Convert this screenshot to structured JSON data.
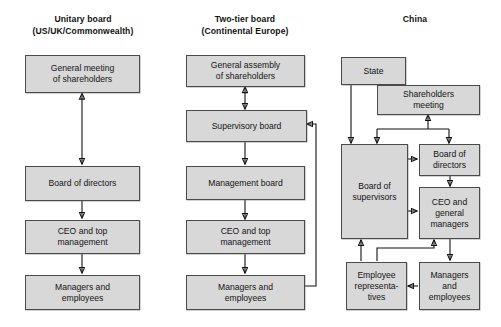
{
  "figure": {
    "kind": "comparative-org-chart",
    "columns": [
      {
        "id": "unitary",
        "title_line1": "Unitary board",
        "title_line2": "(US/UK/Commonwealth)",
        "nodes": [
          {
            "id": "u1",
            "label": "General meeting\nof shareholders"
          },
          {
            "id": "u2",
            "label": "Board of directors"
          },
          {
            "id": "u3",
            "label": "CEO and top\nmanagement"
          },
          {
            "id": "u4",
            "label": "Managers and\nemployees"
          }
        ],
        "edges": [
          {
            "from": "u1",
            "to": "u2",
            "style": "double-arrow"
          },
          {
            "from": "u2",
            "to": "u3",
            "style": "arrow-down"
          },
          {
            "from": "u3",
            "to": "u4",
            "style": "arrow-down"
          }
        ]
      },
      {
        "id": "twotier",
        "title_line1": "Two-tier board",
        "title_line2": "(Continental Europe)",
        "nodes": [
          {
            "id": "t1",
            "label": "General assembly\nof shareholders"
          },
          {
            "id": "t2",
            "label": "Supervisory board"
          },
          {
            "id": "t3",
            "label": "Management board"
          },
          {
            "id": "t4",
            "label": "CEO and top\nmanagement"
          },
          {
            "id": "t5",
            "label": "Managers and\nemployees"
          }
        ],
        "edges": [
          {
            "from": "t1",
            "to": "t2",
            "style": "double-arrow"
          },
          {
            "from": "t2",
            "to": "t3",
            "style": "arrow-down"
          },
          {
            "from": "t3",
            "to": "t4",
            "style": "arrow-down"
          },
          {
            "from": "t4",
            "to": "t5",
            "style": "arrow-down"
          },
          {
            "from": "t5",
            "to": "t2",
            "style": "feedback-right-loop"
          }
        ]
      },
      {
        "id": "china",
        "title_line1": "China",
        "title_line2": "",
        "nodes": [
          {
            "id": "c1",
            "label": "State"
          },
          {
            "id": "c2",
            "label": "Shareholders\nmeeting"
          },
          {
            "id": "c3",
            "label": "Board of\nsupervisors"
          },
          {
            "id": "c4",
            "label": "Board of\ndirectors"
          },
          {
            "id": "c5",
            "label": "CEO and\ngeneral\nmanagers"
          },
          {
            "id": "c6",
            "label": "Employee\nrepresenta-\ntives"
          },
          {
            "id": "c7",
            "label": "Managers\nand\nemployees"
          }
        ],
        "edges": [
          {
            "from": "c1",
            "to": "c3",
            "style": "arrow-down"
          },
          {
            "from": "c2",
            "to": "c3",
            "style": "bus-down"
          },
          {
            "from": "c2",
            "to": "c4",
            "style": "bus-down"
          },
          {
            "from": "c3",
            "to": "c4",
            "style": "arrow-right"
          },
          {
            "from": "c3",
            "to": "c5",
            "style": "arrow-right"
          },
          {
            "from": "c4",
            "to": "c5",
            "style": "arrow-down"
          },
          {
            "from": "c5",
            "to": "c7",
            "style": "arrow-down"
          },
          {
            "from": "c7",
            "to": "c6",
            "style": "arrow-left"
          },
          {
            "from": "c6",
            "to": "c3",
            "style": "arrow-up"
          },
          {
            "from": "c6",
            "to": "c5",
            "style": "elbow-up"
          },
          {
            "from": "c3",
            "to": "c2",
            "style": "bus-up"
          }
        ]
      }
    ],
    "colors": {
      "node_fill": "#d8d8d8",
      "node_border": "#4a4a4a",
      "connector": "#111111",
      "background": "#ffffff",
      "text": "#141414"
    }
  }
}
